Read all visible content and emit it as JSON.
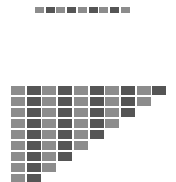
{
  "colors": {
    "light": "#8c8c8c",
    "dark": "#555555",
    "background": "#ffffff"
  },
  "top_row": {
    "x0": 35,
    "y": 7,
    "step": 10.7,
    "count": 9,
    "pattern": [
      "light",
      "dark",
      "light",
      "dark",
      "light",
      "dark",
      "light",
      "dark",
      "light"
    ]
  },
  "staircase": {
    "x0": 11,
    "y0": 86,
    "col_step": 15.7,
    "row_step": 11,
    "row_counts": [
      10,
      9,
      8,
      7,
      6,
      5,
      4,
      3,
      2
    ],
    "pattern": [
      "light",
      "dark",
      "light",
      "dark",
      "light",
      "dark",
      "light",
      "dark",
      "light",
      "dark"
    ]
  }
}
